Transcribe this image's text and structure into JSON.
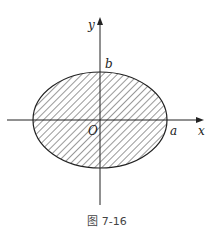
{
  "figure": {
    "caption": "图 7-16",
    "labels": {
      "x_axis": "x",
      "y_axis": "y",
      "origin": "O",
      "a": "a",
      "b": "b"
    },
    "shape": "ellipse",
    "fill": "hatched",
    "colors": {
      "stroke": "#222222",
      "background": "#ffffff"
    }
  }
}
